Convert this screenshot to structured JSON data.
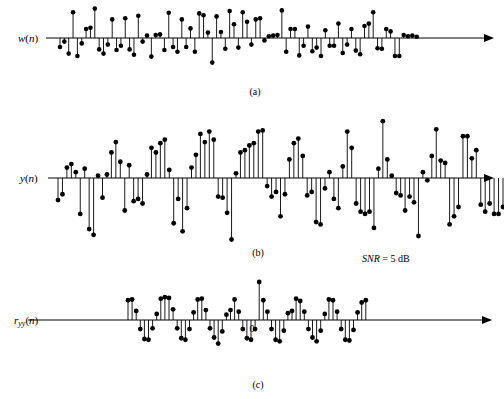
{
  "figure": {
    "title_visible": false,
    "background_color": "#ffffff",
    "ink_color": "#000000"
  },
  "panels": [
    {
      "id": "panel-a",
      "caption": "(a)",
      "y_label": "w(n)",
      "y_label_italic_part": "w",
      "y_label_arg": "(n)"
    },
    {
      "id": "panel-b",
      "caption": "(b)",
      "y_label": "y(n)",
      "y_label_italic_part": "y",
      "y_label_arg": "(n)"
    },
    {
      "id": "panel-c",
      "caption": "(c)",
      "y_label": "ryy(n)",
      "y_label_italic_part": "r",
      "y_label_sub": "yy",
      "y_label_arg": "(n)",
      "origin_mark": "0"
    }
  ],
  "annotations": {
    "snr_symbol": "SNR",
    "snr_equals": " = ",
    "snr_value": "5 dB",
    "snr_full": "SNR = 5 dB"
  },
  "chart_data": [
    {
      "type": "stem",
      "id": "panel-a",
      "title": "(a)",
      "ylabel": "w(n)",
      "xlabel": "",
      "grid": false,
      "legend": null,
      "axis": {
        "baseline_y": 38,
        "x_start": 46,
        "x_end": 492,
        "arrow": "right"
      },
      "x_start": 60,
      "x_step": 4.35,
      "ylim": [
        -1.0,
        1.0
      ],
      "values": [
        -0.3,
        -0.12,
        -0.52,
        0.86,
        -0.6,
        -0.18,
        0.3,
        0.34,
        0.98,
        -0.38,
        -0.52,
        -0.22,
        0.62,
        -0.4,
        -0.26,
        0.66,
        -0.38,
        -0.56,
        0.74,
        -0.12,
        0.08,
        -0.62,
        0.1,
        0.12,
        -0.4,
        0.84,
        -0.3,
        -0.46,
        0.62,
        -0.3,
        0.32,
        -0.46,
        0.82,
        0.76,
        0.18,
        -0.82,
        0.72,
        0.2,
        -0.36,
        0.9,
        0.46,
        -0.32,
        0.86,
        0.54,
        -0.22,
        0.62,
        0.66,
        -0.08,
        0.06,
        0.08,
        0.1,
        0.92,
        -0.46,
        0.3,
        0.3,
        -0.58,
        -0.26,
        0.38,
        -0.44,
        -0.32,
        -0.6,
        0.26,
        -0.26,
        -0.26,
        0.48,
        -0.5,
        -0.22,
        0.3,
        -0.42,
        -0.54,
        0.4,
        0.48,
        0.86,
        -0.34,
        -0.36,
        0.3,
        0.22,
        -0.6,
        -0.6,
        0.1,
        0.06,
        0.08,
        0.04
      ]
    },
    {
      "type": "stem",
      "id": "panel-b",
      "title": "(b)",
      "ylabel": "y(n)",
      "xlabel": "",
      "grid": false,
      "legend": null,
      "axis": {
        "baseline_y": 178,
        "x_start": 48,
        "x_end": 492,
        "arrow": "right"
      },
      "x_start": 58,
      "x_step": 4.45,
      "ylim": [
        -1.0,
        1.0
      ],
      "values": [
        -0.38,
        -0.28,
        0.18,
        0.24,
        0.1,
        -0.62,
        0.16,
        -0.88,
        -0.98,
        0.04,
        -0.34,
        0.06,
        0.44,
        0.62,
        0.28,
        -0.56,
        0.22,
        -0.4,
        -0.36,
        -0.44,
        0.06,
        0.52,
        0.44,
        0.6,
        0.66,
        0.14,
        -0.78,
        -0.36,
        -0.92,
        -0.52,
        0.18,
        0.4,
        0.76,
        0.62,
        0.8,
        0.66,
        -0.32,
        -0.34,
        -0.6,
        -1.06,
        0.08,
        0.44,
        0.48,
        0.56,
        0.6,
        0.8,
        0.82,
        -0.14,
        -0.32,
        -0.24,
        -0.66,
        -0.28,
        0.32,
        0.6,
        0.68,
        0.38,
        -0.3,
        -0.24,
        -0.76,
        -0.8,
        -0.18,
        0.1,
        -0.36,
        -0.52,
        0.2,
        0.8,
        0.52,
        -0.44,
        -0.58,
        -0.62,
        -0.58,
        -0.86,
        0.16,
        0.98,
        0.32,
        0.04,
        -0.26,
        -0.3,
        -0.56,
        -0.32,
        -0.42,
        -1.0,
        0.1,
        -0.04,
        0.38,
        0.84,
        0.3,
        0.26,
        -0.8,
        -0.66,
        -0.5,
        0.72,
        0.72,
        0.34,
        0.48,
        -0.46,
        -0.58,
        -0.44,
        -0.62,
        -0.62,
        -0.5
      ]
    },
    {
      "type": "stem",
      "id": "panel-c",
      "title": "(c)",
      "ylabel": "ryy(n)",
      "xlabel": "",
      "grid": false,
      "legend": null,
      "origin_label": "0",
      "axis": {
        "baseline_y": 320,
        "x_start": 28,
        "x_end": 490,
        "arrow": "right"
      },
      "x_start": 128,
      "x_step": 4.1,
      "center_index": 32,
      "ylim": [
        -1.0,
        1.0
      ],
      "values": [
        0.52,
        0.54,
        0.24,
        -0.24,
        -0.5,
        -0.52,
        -0.22,
        0.16,
        0.56,
        0.6,
        0.58,
        0.28,
        -0.22,
        -0.48,
        -0.52,
        -0.24,
        0.2,
        0.54,
        0.56,
        0.26,
        -0.22,
        -0.46,
        -0.62,
        -0.3,
        0.14,
        0.26,
        0.54,
        0.22,
        -0.24,
        -0.48,
        -0.52,
        -0.24,
        1.0,
        0.52,
        0.22,
        -0.24,
        -0.52,
        -0.56,
        -0.28,
        0.18,
        0.24,
        0.56,
        0.5,
        0.22,
        -0.24,
        -0.46,
        -0.56,
        -0.28,
        0.16,
        0.54,
        0.52,
        0.22,
        -0.24,
        -0.52,
        -0.54,
        -0.26,
        0.2,
        0.46,
        0.52
      ]
    }
  ]
}
